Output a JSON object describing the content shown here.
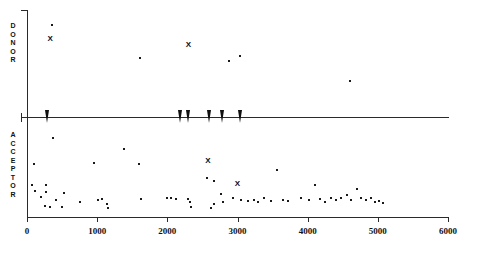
{
  "chart_data": {
    "type": "scatter",
    "title": "",
    "xlabel": "",
    "ylabel": "",
    "xlim": [
      0,
      6000
    ],
    "xticks": [
      0,
      1000,
      2000,
      3000,
      4000,
      5000,
      6000
    ],
    "xticklabels": [
      "0",
      "1000",
      "2000",
      "3000",
      "4000",
      "5000",
      "6000"
    ],
    "grid": false,
    "legend": "none",
    "panels": [
      {
        "name": "donor",
        "label": "DONOR",
        "label_letters": [
          "D",
          "O",
          "N",
          "O",
          "R"
        ],
        "axis_direction": "up",
        "series": [
          {
            "name": "donor-points",
            "marker": "dot",
            "points": [
              {
                "x": 360,
                "y": 0.88
              },
              {
                "x": 1610,
                "y": 0.56
              },
              {
                "x": 2880,
                "y": 0.53
              },
              {
                "x": 3030,
                "y": 0.58
              },
              {
                "x": 4600,
                "y": 0.34
              }
            ]
          },
          {
            "name": "donor-highlights",
            "marker": "x",
            "points": [
              {
                "x": 330,
                "y": 0.74
              },
              {
                "x": 2300,
                "y": 0.69
              }
            ]
          }
        ]
      },
      {
        "name": "acceptor",
        "label": "ACCEPTOR",
        "label_letters": [
          "A",
          "C",
          "C",
          "E",
          "P",
          "T",
          "O",
          "R"
        ],
        "axis_direction": "down",
        "series": [
          {
            "name": "acceptor-points",
            "marker": "dot",
            "points": [
              {
                "x": 100,
                "y": 0.48
              },
              {
                "x": 70,
                "y": 0.7
              },
              {
                "x": 110,
                "y": 0.76
              },
              {
                "x": 205,
                "y": 0.82
              },
              {
                "x": 265,
                "y": 0.7
              },
              {
                "x": 270,
                "y": 0.77
              },
              {
                "x": 255,
                "y": 0.92
              },
              {
                "x": 330,
                "y": 0.93
              },
              {
                "x": 370,
                "y": 0.22
              },
              {
                "x": 420,
                "y": 0.86
              },
              {
                "x": 500,
                "y": 0.93
              },
              {
                "x": 530,
                "y": 0.78
              },
              {
                "x": 760,
                "y": 0.88
              },
              {
                "x": 960,
                "y": 0.47
              },
              {
                "x": 1010,
                "y": 0.86
              },
              {
                "x": 1070,
                "y": 0.85
              },
              {
                "x": 1140,
                "y": 0.9
              },
              {
                "x": 1160,
                "y": 0.94
              },
              {
                "x": 1380,
                "y": 0.33
              },
              {
                "x": 1600,
                "y": 0.48
              },
              {
                "x": 1620,
                "y": 0.85
              },
              {
                "x": 1990,
                "y": 0.84
              },
              {
                "x": 2050,
                "y": 0.84
              },
              {
                "x": 2120,
                "y": 0.85
              },
              {
                "x": 2290,
                "y": 0.85
              },
              {
                "x": 2330,
                "y": 0.88
              },
              {
                "x": 2340,
                "y": 0.93
              },
              {
                "x": 2570,
                "y": 0.63
              },
              {
                "x": 2660,
                "y": 0.66
              },
              {
                "x": 2660,
                "y": 0.9
              },
              {
                "x": 2620,
                "y": 0.94
              },
              {
                "x": 2760,
                "y": 0.79
              },
              {
                "x": 2790,
                "y": 0.88
              },
              {
                "x": 2940,
                "y": 0.84
              },
              {
                "x": 3050,
                "y": 0.86
              },
              {
                "x": 3150,
                "y": 0.87
              },
              {
                "x": 3230,
                "y": 0.86
              },
              {
                "x": 3290,
                "y": 0.88
              },
              {
                "x": 3380,
                "y": 0.83
              },
              {
                "x": 3480,
                "y": 0.87
              },
              {
                "x": 3560,
                "y": 0.55
              },
              {
                "x": 3650,
                "y": 0.86
              },
              {
                "x": 3720,
                "y": 0.87
              },
              {
                "x": 3900,
                "y": 0.84
              },
              {
                "x": 4020,
                "y": 0.86
              },
              {
                "x": 4100,
                "y": 0.7
              },
              {
                "x": 4180,
                "y": 0.85
              },
              {
                "x": 4250,
                "y": 0.88
              },
              {
                "x": 4330,
                "y": 0.83
              },
              {
                "x": 4400,
                "y": 0.86
              },
              {
                "x": 4480,
                "y": 0.84
              },
              {
                "x": 4560,
                "y": 0.8
              },
              {
                "x": 4620,
                "y": 0.86
              },
              {
                "x": 4700,
                "y": 0.74
              },
              {
                "x": 4760,
                "y": 0.83
              },
              {
                "x": 4830,
                "y": 0.86
              },
              {
                "x": 4900,
                "y": 0.84
              },
              {
                "x": 4960,
                "y": 0.88
              },
              {
                "x": 5020,
                "y": 0.87
              },
              {
                "x": 5080,
                "y": 0.89
              }
            ]
          },
          {
            "name": "acceptor-highlights",
            "marker": "x",
            "points": [
              {
                "x": 2580,
                "y": 0.45
              },
              {
                "x": 3000,
                "y": 0.69
              }
            ]
          }
        ]
      }
    ],
    "axis_markers": {
      "name": "arrow-markers",
      "marker": "down-arrow",
      "x_values": [
        290,
        2180,
        2300,
        2600,
        2780,
        3030
      ]
    }
  }
}
